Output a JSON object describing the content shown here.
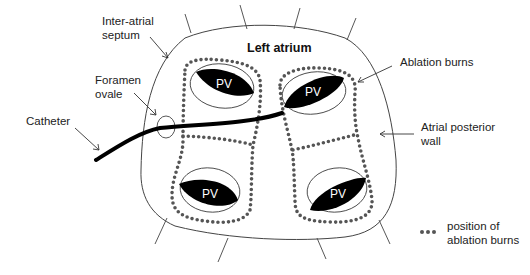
{
  "diagram": {
    "title": "Left atrium",
    "labels": {
      "inter_atrial_septum": [
        "Inter-atrial",
        "septum"
      ],
      "foramen_ovale": [
        "Foramen",
        "ovale"
      ],
      "catheter": "Catheter",
      "ablation_burns": "Ablation burns",
      "atrial_posterior_wall": [
        "Atrial posterior",
        "wall"
      ]
    },
    "pulmonary_veins": [
      {
        "label": "PV",
        "position": "upper-left"
      },
      {
        "label": "PV",
        "position": "upper-right"
      },
      {
        "label": "PV",
        "position": "lower-left"
      },
      {
        "label": "PV",
        "position": "lower-right"
      }
    ],
    "legend": {
      "symbol": "•••",
      "text": [
        "position of",
        "ablation burns"
      ]
    },
    "colors": {
      "outline": "#333333",
      "dots": "#555555",
      "pv_fill": "#000000",
      "catheter": "#000000"
    }
  }
}
